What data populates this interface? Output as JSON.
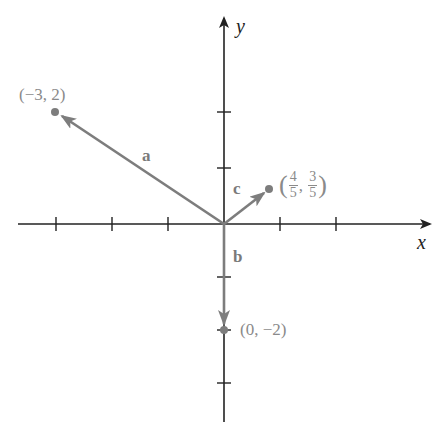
{
  "figure": {
    "axes": {
      "x_label": "x",
      "y_label": "y",
      "origin_px": [
        224,
        224
      ],
      "unit_px": 56,
      "x_ticks": [
        -3,
        -2,
        -1,
        1,
        2
      ],
      "y_ticks": [
        -3,
        -2,
        -1,
        1,
        2
      ]
    },
    "vectors": [
      {
        "name": "a",
        "label": "a",
        "to": [
          -3,
          2
        ],
        "point_label": "(−3, 2)"
      },
      {
        "name": "b",
        "label": "b",
        "to": [
          0,
          -2
        ],
        "point_label": "(0, −2)"
      },
      {
        "name": "c",
        "label": "c",
        "to": [
          0.8,
          0.6
        ],
        "point_label_num_x": "4",
        "point_label_den_x": "5",
        "point_label_num_y": "3",
        "point_label_den_y": "5"
      }
    ],
    "colors": {
      "axis": "#222222",
      "vector": "#7d7d7d",
      "label": "#8a8a8a"
    }
  }
}
